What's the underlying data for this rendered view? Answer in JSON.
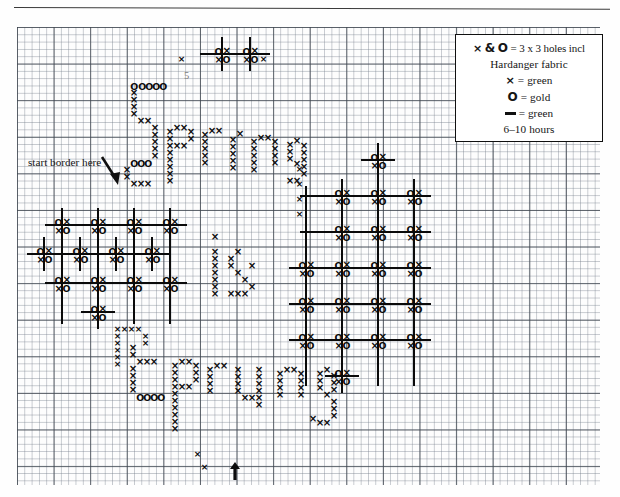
{
  "document": {
    "type": "cross-stitch-pattern-chart",
    "title_text": "Spring is Sprung",
    "stitched_words": [
      "Spring",
      "is",
      "Sprung"
    ]
  },
  "legend": {
    "box_lines": [
      "× & O = 3 x 3 holes incl",
      "Hardanger fabric",
      "× = green",
      "O = gold",
      "— = green",
      "6–10 hours"
    ],
    "line1_symbol_x": "×",
    "line1_amp": "&",
    "line1_symbol_o": "O",
    "line1_text": "= 3 x 3 holes incl",
    "line2_text": "Hardanger fabric",
    "line3_symbol": "×",
    "line3_text": "= green",
    "line4_symbol": "O",
    "line4_text": "= gold",
    "line5_text": "= green",
    "line6_text": "6–10 hours",
    "colors": {
      "x_thread": "green",
      "o_thread": "gold",
      "backstitch": "green"
    },
    "time_estimate": "6–10 hours",
    "fabric": "Hardanger fabric",
    "unit": "3 x 3 holes incl"
  },
  "annotations": {
    "start_border": "start border here",
    "count_mark": "5",
    "center_arrow": "↑"
  },
  "grid": {
    "fine_cell_px": 7.32,
    "bold_every": 5,
    "cols": 80,
    "rows": 63,
    "line_color": "#2a2f38"
  },
  "chart_data": {
    "type": "table",
    "symbols": [
      {
        "key": "x",
        "glyph": "×",
        "meaning": "green cross stitch"
      },
      {
        "key": "o",
        "glyph": "O",
        "meaning": "gold stitch"
      },
      {
        "key": "dash",
        "glyph": "—",
        "meaning": "green backstitch"
      }
    ]
  },
  "motif_clusters": {
    "left_border": [
      [
        62,
        225
      ],
      [
        98,
        225
      ],
      [
        134,
        225
      ],
      [
        170,
        225
      ],
      [
        44,
        254
      ],
      [
        80,
        254
      ],
      [
        116,
        254
      ],
      [
        152,
        254
      ],
      [
        62,
        283
      ],
      [
        98,
        283
      ],
      [
        134,
        283
      ],
      [
        170,
        283
      ],
      [
        98,
        312
      ]
    ],
    "right_border": [
      [
        378,
        160
      ],
      [
        342,
        196
      ],
      [
        378,
        196
      ],
      [
        414,
        196
      ],
      [
        342,
        232
      ],
      [
        378,
        232
      ],
      [
        414,
        232
      ],
      [
        306,
        268
      ],
      [
        342,
        268
      ],
      [
        378,
        268
      ],
      [
        414,
        268
      ],
      [
        306,
        304
      ],
      [
        342,
        304
      ],
      [
        378,
        304
      ],
      [
        414,
        304
      ],
      [
        306,
        340
      ],
      [
        342,
        340
      ],
      [
        378,
        340
      ],
      [
        414,
        340
      ],
      [
        342,
        376
      ]
    ],
    "top_center": [
      [
        222,
        54
      ],
      [
        250,
        54
      ]
    ]
  }
}
